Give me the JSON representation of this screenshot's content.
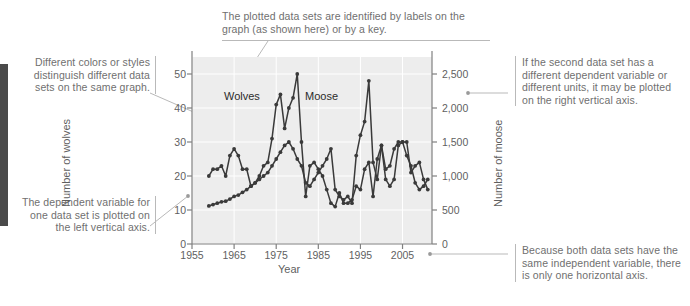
{
  "annotations": {
    "top": "The plotted data sets are identified by labels on the graph (as shown here) or by a key.",
    "left_upper": "Different colors or styles distinguish different data sets on the same graph.",
    "left_lower": "The dependent variable for one data set is plotted on the left vertical axis.",
    "right_upper": "If the second data set has a different dependent variable or different units, it may be plotted on the right vertical axis.",
    "right_lower": "Because both data sets have the same independent variable, there is only one horizontal axis."
  },
  "colors": {
    "plot_background": "#ededed",
    "series_line": "#3a3a3a",
    "annotation_text": "#6f6f6f",
    "axis_text": "#5f5f5f",
    "leader_line": "#b9b9b9",
    "edge_bar": "#4a4a4a"
  },
  "chart_data": {
    "type": "line",
    "title": "",
    "xlabel": "Year",
    "ylabel": "Number of wolves",
    "ylabel_right": "Number of moose",
    "grid": true,
    "legend": "inline-labels",
    "xlim": [
      1955,
      2012
    ],
    "xticks": [
      1955,
      1965,
      1975,
      1985,
      1995,
      2005
    ],
    "xtick_labels": [
      "1955",
      "1965",
      "1975",
      "1985",
      "1995",
      "2005"
    ],
    "ylim_left": [
      0,
      55
    ],
    "yticks_left": [
      0,
      10,
      20,
      30,
      40,
      50
    ],
    "ytick_labels_left": [
      "0",
      "10",
      "20",
      "30",
      "40",
      "50"
    ],
    "ylim_right": [
      0,
      2750
    ],
    "yticks_right": [
      0,
      500,
      1000,
      1500,
      2000,
      2500
    ],
    "ytick_labels_right": [
      "0",
      "500",
      "1,000",
      "1,500",
      "2,000",
      "2,500"
    ],
    "series": [
      {
        "name": "Wolves",
        "axis": "left",
        "x": [
          1959,
          1960,
          1961,
          1962,
          1963,
          1964,
          1965,
          1966,
          1967,
          1968,
          1969,
          1970,
          1971,
          1972,
          1973,
          1974,
          1975,
          1976,
          1977,
          1978,
          1979,
          1980,
          1981,
          1982,
          1983,
          1984,
          1985,
          1986,
          1987,
          1988,
          1989,
          1990,
          1991,
          1992,
          1993,
          1994,
          1995,
          1996,
          1997,
          1998,
          1999,
          2000,
          2001,
          2002,
          2003,
          2004,
          2005,
          2006,
          2007,
          2008,
          2009,
          2010,
          2011
        ],
        "values": [
          20,
          22,
          22,
          23,
          20,
          26,
          28,
          26,
          22,
          22,
          17,
          18,
          20,
          23,
          24,
          31,
          41,
          44,
          34,
          40,
          43,
          50,
          30,
          14,
          23,
          24,
          22,
          20,
          16,
          12,
          11,
          15,
          12,
          12,
          13,
          17,
          16,
          22,
          24,
          14,
          25,
          29,
          19,
          17,
          19,
          29,
          30,
          30,
          21,
          23,
          24,
          19,
          16
        ]
      },
      {
        "name": "Moose",
        "axis": "right",
        "x": [
          1959,
          1960,
          1961,
          1962,
          1963,
          1964,
          1965,
          1966,
          1967,
          1968,
          1969,
          1970,
          1971,
          1972,
          1973,
          1974,
          1975,
          1976,
          1977,
          1978,
          1979,
          1980,
          1981,
          1982,
          1983,
          1984,
          1985,
          1986,
          1987,
          1988,
          1989,
          1990,
          1991,
          1992,
          1993,
          1994,
          1995,
          1996,
          1997,
          1998,
          1999,
          2000,
          2001,
          2002,
          2003,
          2004,
          2005,
          2006,
          2007,
          2008,
          2009,
          2010,
          2011
        ],
        "values": [
          560,
          580,
          600,
          620,
          630,
          660,
          700,
          720,
          760,
          800,
          850,
          900,
          950,
          1000,
          1050,
          1150,
          1250,
          1350,
          1450,
          1500,
          1400,
          1250,
          1150,
          900,
          850,
          950,
          1050,
          1150,
          1250,
          1400,
          800,
          700,
          650,
          700,
          600,
          1300,
          1600,
          1800,
          2400,
          1200,
          950,
          1450,
          1100,
          1150,
          1400,
          1500,
          1500,
          1300,
          1150,
          900,
          800,
          850,
          950
        ]
      }
    ],
    "point_annotations": [
      {
        "label": "Wolves",
        "x": 1972,
        "note": "inline series label"
      },
      {
        "label": "Moose",
        "x": 1985,
        "note": "inline series label"
      }
    ]
  }
}
